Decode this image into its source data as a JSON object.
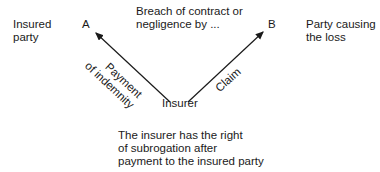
{
  "diagram": {
    "nodes": {
      "insured_label": [
        "Insured",
        "party"
      ],
      "a": "A",
      "breach": [
        "Breach of contract or",
        "negligence by ..."
      ],
      "b": "B",
      "party_causing": [
        "Party causing",
        "the loss"
      ],
      "insurer": "Insurer"
    },
    "edges": {
      "payment": [
        "Payment",
        "of indemnity"
      ],
      "claim": "Claim"
    },
    "note": [
      "The insurer has the right",
      "of subrogation after",
      "payment to the insured party"
    ],
    "colors": {
      "line": "#1a1a1a",
      "text": "#1a1a1a"
    }
  }
}
